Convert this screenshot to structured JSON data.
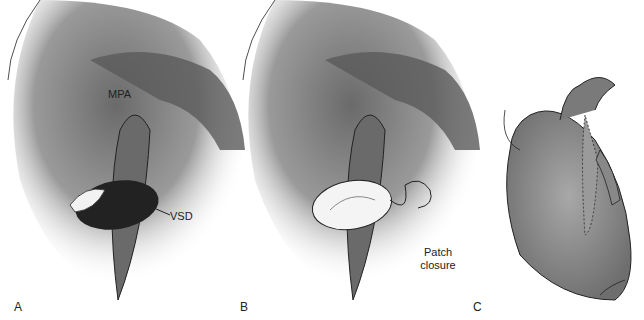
{
  "figure": {
    "panels": [
      {
        "id": "A",
        "label": "A",
        "annotations": [
          "MPA",
          "VSD"
        ]
      },
      {
        "id": "B",
        "label": "B",
        "annotations": [
          "Patch",
          "closure"
        ]
      },
      {
        "id": "C",
        "label": "C",
        "annotations": []
      }
    ],
    "labels": {
      "mpa": "MPA",
      "vsd": "VSD",
      "patch_line1": "Patch",
      "patch_line2": "closure",
      "panel_a": "A",
      "panel_b": "B",
      "panel_c": "C"
    },
    "colors": {
      "shade_dark": "#555555",
      "shade_mid": "#8a8a8a",
      "shade_light": "#cfcfcf",
      "line": "#222222"
    }
  }
}
